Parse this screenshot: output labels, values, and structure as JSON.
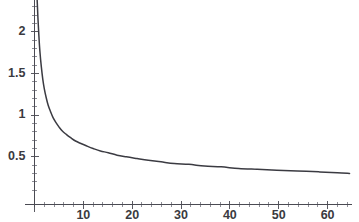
{
  "chart_data": {
    "type": "line",
    "title": "",
    "subtitle": "",
    "xlabel": "",
    "ylabel": "",
    "xlim": [
      0,
      65
    ],
    "ylim": [
      0,
      2.4
    ],
    "grid": false,
    "legend": null,
    "legend_position": "none",
    "x_ticks": [
      10,
      20,
      30,
      40,
      50,
      60
    ],
    "x_tick_labels": [
      "10",
      "20",
      "30",
      "40",
      "50",
      "60"
    ],
    "x_minor_tick_step": 2,
    "y_ticks": [
      0.5,
      1,
      1.5,
      2
    ],
    "y_tick_labels": [
      "0.5",
      "1",
      "1.5",
      "2"
    ],
    "y_minor_tick_step": 0.1,
    "series": [
      {
        "name": "decay",
        "color": "#3b3b42",
        "x": [
          0.5,
          0.7,
          0.9,
          1.1,
          1.4,
          1.7,
          2.0,
          2.4,
          2.8,
          3.3,
          3.8,
          4.4,
          5.0,
          5.7,
          6.5,
          7.4,
          8.4,
          9.5,
          10.7,
          12.0,
          13.5,
          15.1,
          16.9,
          18.8,
          21.0,
          23.3,
          25.9,
          28.6,
          31.6,
          34.8,
          38.2,
          41.8,
          45.6,
          49.6,
          53.8,
          58.2,
          62.0,
          64.5
        ],
        "y": [
          2.42,
          2.17,
          1.95,
          1.77,
          1.58,
          1.43,
          1.32,
          1.21,
          1.12,
          1.04,
          0.97,
          0.91,
          0.86,
          0.81,
          0.77,
          0.73,
          0.69,
          0.66,
          0.63,
          0.6,
          0.57,
          0.55,
          0.52,
          0.5,
          0.48,
          0.46,
          0.44,
          0.42,
          0.41,
          0.39,
          0.38,
          0.36,
          0.35,
          0.34,
          0.33,
          0.32,
          0.31,
          0.3
        ]
      }
    ],
    "annotations": []
  },
  "axes": {
    "x_axis_name": "x-axis",
    "y_axis_name": "y-axis"
  }
}
